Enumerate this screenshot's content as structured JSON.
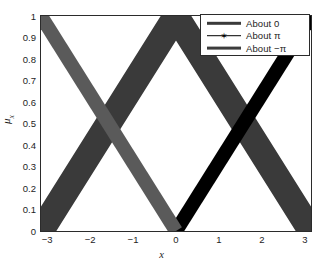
{
  "chart_data": {
    "type": "line",
    "title": "",
    "xlabel": "x",
    "ylabel": "μ_x",
    "ylabel_base": "μ",
    "ylabel_sub": "x",
    "xlim": [
      -3.14159,
      3.14159
    ],
    "ylim": [
      0,
      1
    ],
    "grid": false,
    "legend_position": "top-right",
    "xticks": [
      -3,
      -2,
      -1,
      0,
      1,
      2,
      3
    ],
    "xticklabels": [
      "−3",
      "−2",
      "−1",
      "0",
      "1",
      "2",
      "3"
    ],
    "yticks": [
      0,
      0.1,
      0.2,
      0.3,
      0.4,
      0.5,
      0.6,
      0.7,
      0.8,
      0.9,
      1
    ],
    "yticklabels": [
      "0",
      "0.1",
      "0.2",
      "0.3",
      "0.4",
      "0.5",
      "0.6",
      "0.7",
      "0.8",
      "0.9",
      "1"
    ],
    "series": [
      {
        "name": "About 0",
        "color": "#3a3a3a",
        "linewidth_px": 26,
        "marker": "none",
        "description": "Triangular membership peaking at x=0",
        "x": [
          -3.14159,
          0,
          3.14159
        ],
        "y": [
          0,
          1,
          0
        ]
      },
      {
        "name": "About π",
        "color": "#000000",
        "linewidth_px": 14,
        "marker": "asterisk",
        "description": "Rising ramp membership reaching 1 at x=π",
        "x": [
          0,
          3.14159
        ],
        "y": [
          0,
          1
        ]
      },
      {
        "name": "About −π",
        "color": "#5a5a5a",
        "linewidth_px": 14,
        "marker": "none",
        "description": "Falling ramp membership, 1 at x=−π down to 0 at x=0",
        "x": [
          -3.14159,
          0
        ],
        "y": [
          1,
          0
        ]
      }
    ]
  },
  "legend": {
    "items": [
      {
        "label": "About 0",
        "color": "#3a3a3a",
        "thickness": 2.4,
        "marker": "none"
      },
      {
        "label": "About π",
        "color": "#000000",
        "thickness": 1.6,
        "marker": "✶"
      },
      {
        "label": "About −π",
        "color": "#3c3c3c",
        "thickness": 2.8,
        "marker": "none"
      }
    ]
  },
  "axes": {
    "frame_color": "#2b2b2b",
    "background": "#ffffff"
  }
}
